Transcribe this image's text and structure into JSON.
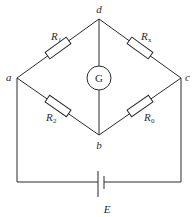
{
  "diagram": {
    "type": "wheatstone-bridge",
    "nodes": {
      "top": "d",
      "left": "a",
      "right": "c",
      "bottom": "b"
    },
    "resistors": [
      {
        "id": "r1",
        "symbol": "R",
        "subscript": "1",
        "between": [
          "a",
          "d"
        ]
      },
      {
        "id": "rx",
        "symbol": "R",
        "subscript": "x",
        "between": [
          "d",
          "c"
        ]
      },
      {
        "id": "r2",
        "symbol": "R",
        "subscript": "2",
        "between": [
          "a",
          "b"
        ]
      },
      {
        "id": "r0",
        "symbol": "R",
        "subscript": "0",
        "between": [
          "b",
          "c"
        ]
      }
    ],
    "galvanometer": {
      "label": "G",
      "between": [
        "d",
        "b"
      ]
    },
    "battery": {
      "label": "E",
      "between": [
        "a",
        "c"
      ]
    },
    "colors": {
      "line": "#2b2b2b",
      "background": "#ffffff"
    }
  }
}
